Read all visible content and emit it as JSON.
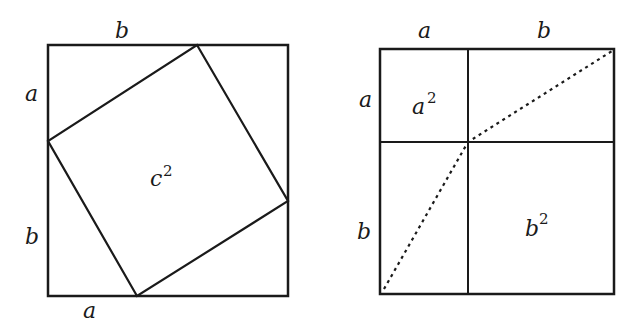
{
  "colors": {
    "stroke": "#1a1a1a",
    "background": "#ffffff"
  },
  "left_figure": {
    "description": "Square of side a+b with inscribed tilted square of side c",
    "outer_square": {
      "x": 48,
      "y": 45,
      "size": 240
    },
    "inner_square": [
      [
        197,
        45
      ],
      [
        288,
        201
      ],
      [
        137,
        296
      ],
      [
        48,
        141
      ]
    ],
    "labels": {
      "top": "b",
      "left_upper": "a",
      "left_lower": "b",
      "bottom": "a",
      "center_base": "c",
      "center_exp": "2"
    }
  },
  "right_figure": {
    "description": "Square of side a+b divided into a², b² and two rectangles with dotted diagonals",
    "outer_square": {
      "x": 380,
      "y": 48,
      "size": 234
    },
    "divider_x": 468,
    "divider_y": 142,
    "dotted_line": [
      [
        382,
        291
      ],
      [
        468,
        142
      ],
      [
        612,
        50
      ]
    ],
    "labels": {
      "top_left": "a",
      "top_right": "b",
      "left_upper": "a",
      "left_lower": "b",
      "small_square_base": "a",
      "small_square_exp": "2",
      "large_square_base": "b",
      "large_square_exp": "2"
    }
  }
}
